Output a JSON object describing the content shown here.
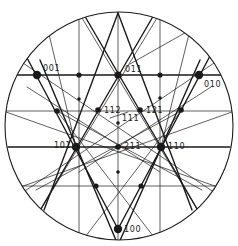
{
  "diagram": {
    "colors": {
      "ink": "#1a1a1a",
      "background": "#ffffff"
    },
    "circle": {
      "cx": 119,
      "cy": 126,
      "r": 114
    },
    "thick_lines": [
      [
        12,
        75,
        226,
        75
      ],
      [
        8,
        147,
        230,
        147
      ],
      [
        26,
        56,
        118,
        229
      ],
      [
        210,
        56,
        118,
        229
      ],
      [
        83,
        13,
        200,
        214
      ],
      [
        155,
        13,
        38,
        214
      ],
      [
        118,
        13,
        44,
        210
      ],
      [
        118,
        13,
        192,
        210
      ],
      [
        40,
        60,
        118,
        245
      ],
      [
        200,
        60,
        118,
        245
      ]
    ],
    "thin_lines": [
      [
        118,
        12,
        118,
        240
      ],
      [
        79,
        15,
        79,
        240
      ],
      [
        160,
        15,
        160,
        240
      ],
      [
        5,
        111,
        233,
        111
      ],
      [
        10,
        186,
        228,
        186
      ],
      [
        48,
        30,
        76,
        147
      ],
      [
        190,
        30,
        161,
        147
      ],
      [
        20,
        61,
        221,
        197
      ],
      [
        217,
        61,
        16,
        197
      ],
      [
        6,
        112,
        226,
        190
      ],
      [
        232,
        112,
        12,
        190
      ],
      [
        27,
        87,
        160,
        172
      ],
      [
        211,
        87,
        79,
        172
      ],
      [
        36,
        190,
        181,
        111
      ],
      [
        202,
        190,
        57,
        111
      ],
      [
        79,
        13,
        200,
        214
      ],
      [
        160,
        13,
        38,
        214
      ],
      [
        57,
        111,
        160,
        245
      ],
      [
        181,
        111,
        79,
        245
      ],
      [
        130,
        64,
        190,
        30
      ],
      [
        110,
        118,
        128,
        112
      ]
    ],
    "nodes": [
      {
        "id": "001",
        "x": 37,
        "y": 75,
        "r": 4.2,
        "label": "001",
        "lx": 43,
        "ly": 71
      },
      {
        "id": "011",
        "x": 118,
        "y": 75,
        "r": 3.6,
        "label": "011",
        "lx": 125,
        "ly": 72
      },
      {
        "id": "010",
        "x": 199,
        "y": 75,
        "r": 4.2,
        "label": "010",
        "lx": 204,
        "ly": 87
      },
      {
        "id": "t1",
        "x": 79,
        "y": 75,
        "r": 2.6,
        "label": ""
      },
      {
        "id": "t2",
        "x": 160,
        "y": 75,
        "r": 2.6,
        "label": ""
      },
      {
        "id": "s1",
        "x": 79,
        "y": 99,
        "r": 1.8,
        "label": ""
      },
      {
        "id": "s2",
        "x": 160,
        "y": 98,
        "r": 1.8,
        "label": ""
      },
      {
        "id": "o1",
        "x": 57,
        "y": 111,
        "r": 2.8,
        "label": ""
      },
      {
        "id": "112",
        "x": 98,
        "y": 110,
        "r": 2.8,
        "label": "112",
        "lx": 104,
        "ly": 113
      },
      {
        "id": "121",
        "x": 140,
        "y": 110,
        "r": 2.8,
        "label": "121",
        "lx": 146,
        "ly": 113
      },
      {
        "id": "o2",
        "x": 181,
        "y": 110,
        "r": 2.8,
        "label": ""
      },
      {
        "id": "111",
        "x": 118,
        "y": 123,
        "r": 1.8,
        "label": "111",
        "lx": 122,
        "ly": 121
      },
      {
        "id": "101",
        "x": 76,
        "y": 147,
        "r": 4.2,
        "label": "101",
        "lx": 54,
        "ly": 148
      },
      {
        "id": "211",
        "x": 118,
        "y": 147,
        "r": 2.8,
        "label": "211",
        "lx": 124,
        "ly": 149
      },
      {
        "id": "110",
        "x": 161,
        "y": 147,
        "r": 4.2,
        "label": "110",
        "lx": 168,
        "ly": 149
      },
      {
        "id": "c1",
        "x": 118,
        "y": 172,
        "r": 1.8,
        "label": ""
      },
      {
        "id": "b1",
        "x": 96,
        "y": 186,
        "r": 2.6,
        "label": ""
      },
      {
        "id": "b2",
        "x": 141,
        "y": 186,
        "r": 2.6,
        "label": ""
      },
      {
        "id": "100",
        "x": 118,
        "y": 229,
        "r": 4.2,
        "label": "100",
        "lx": 124,
        "ly": 232
      }
    ]
  }
}
